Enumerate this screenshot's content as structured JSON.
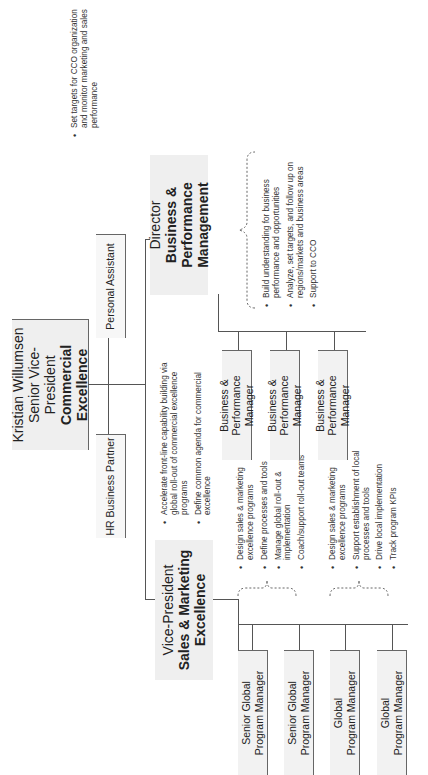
{
  "ceo": {
    "name": "Kristian Willumsen",
    "title": "Senior Vice-President",
    "unit": "Commercial Excellence"
  },
  "staff": {
    "hr": "HR Business Partner",
    "pa": "Personal Assistant"
  },
  "ceo_bullets": [
    "Set targets for CCO organization and monitor marketing and sales performance"
  ],
  "vp": {
    "title": "Vice-President",
    "unit_line1": "Sales & Marketing",
    "unit_line2": "Excellence",
    "bullets": [
      "Accelerate front-line capability building via global roll-out of commercial excellence programs",
      "Define common agenda for commercial excellence"
    ],
    "reports": [
      {
        "line1": "Senior Global",
        "line2": "Program Manager"
      },
      {
        "line1": "Senior Global",
        "line2": "Program Manager"
      },
      {
        "line1": "Global",
        "line2": "Program Manager"
      },
      {
        "line1": "Global",
        "line2": "Program Manager"
      }
    ],
    "senior_bullets": [
      "Design sales & marketing excellence programs",
      "Define processes and tools",
      "Manage global roll-out & implementation",
      "Coach/support roll-out teams"
    ],
    "global_bullets": [
      "Design sales & marketing excellence programs",
      "Support establishment of local processes and tools",
      "Drive local implementation",
      "Track program KPIs"
    ]
  },
  "director": {
    "title": "Director",
    "unit_line1": "Business & Performance",
    "unit_line2": "Management",
    "reports": [
      {
        "line1": "Business & Performance",
        "line2": "Manager"
      },
      {
        "line1": "Business & Performance",
        "line2": "Manager"
      },
      {
        "line1": "Business & Performance",
        "line2": "Manager"
      }
    ],
    "bullets": [
      "Build understanding for business performance and opportunities",
      "Analyze, set targets, and follow up on regions/markets and business areas",
      "Support to CCO"
    ]
  },
  "colors": {
    "box_fill": "#f2f2f2",
    "line": "#555555",
    "text": "#222222"
  }
}
